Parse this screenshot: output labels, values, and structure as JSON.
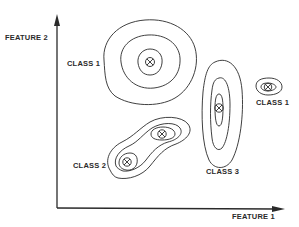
{
  "diagram": {
    "type": "feature-space-clustering",
    "axes": {
      "x_label": "FEATURE 1",
      "y_label": "FEATURE 2"
    },
    "clusters": [
      {
        "id": "class1-large",
        "label": "CLASS 1",
        "center": [
          150,
          62
        ],
        "contour_levels": 3
      },
      {
        "id": "class1-small",
        "label": "CLASS 1",
        "center": [
          268,
          87
        ],
        "contour_levels": 2
      },
      {
        "id": "class3",
        "label": "CLASS 3",
        "center": [
          219,
          108
        ],
        "contour_levels": 3
      },
      {
        "id": "class2",
        "label": "CLASS 2",
        "centers": [
          [
            162,
            134
          ],
          [
            127,
            162
          ]
        ],
        "contour_levels": 3
      }
    ],
    "colors": {
      "line": "#2a2a2a",
      "background": "#ffffff"
    }
  }
}
